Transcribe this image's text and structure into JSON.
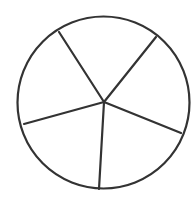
{
  "diagram": {
    "type": "circle-divided-into-sectors",
    "sector_count": 5,
    "stroke_color": "#333333",
    "fill_color": "#ffffff",
    "background": "#ffffff",
    "stroke_width": 2.2,
    "circle": {
      "cx": 103.5,
      "cy": 102.5,
      "r": 86
    },
    "center": {
      "x": 104,
      "y": 102
    },
    "spokes": [
      {
        "name": "top-left",
        "x": 59,
        "y": 32
      },
      {
        "name": "top-right",
        "x": 156,
        "y": 37
      },
      {
        "name": "right",
        "x": 181,
        "y": 133
      },
      {
        "name": "bottom",
        "x": 99,
        "y": 189
      },
      {
        "name": "left",
        "x": 24,
        "y": 124
      }
    ]
  }
}
